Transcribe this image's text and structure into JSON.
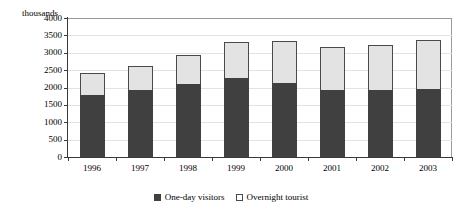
{
  "chart_data": {
    "type": "bar",
    "subtype": "stacked-vertical",
    "title": "",
    "xlabel": "",
    "ylabel": "thousands",
    "categories": [
      "1996",
      "1997",
      "1998",
      "1999",
      "2000",
      "2001",
      "2002",
      "2003"
    ],
    "series": [
      {
        "name": "One-day visitors",
        "color": "#404040",
        "values": [
          1790,
          1930,
          2110,
          2270,
          2140,
          1930,
          1920,
          1960
        ]
      },
      {
        "name": "Overnight tourist",
        "color": "#E3E3E3",
        "values": [
          640,
          690,
          820,
          1040,
          1190,
          1250,
          1300,
          1400
        ]
      }
    ],
    "totals": [
      2430,
      2620,
      2930,
      3310,
      3330,
      3180,
      3220,
      3360
    ],
    "ylim": [
      0,
      4000
    ],
    "ytick_step": 500,
    "yticks": [
      "4000",
      "3500",
      "3000",
      "2500",
      "2000",
      "1500",
      "1000",
      "500",
      "0"
    ],
    "grid": true,
    "legend_position": "bottom"
  },
  "axes": {
    "y_unit_caption": "thousands"
  },
  "legend": {
    "items": [
      {
        "label": "One-day visitors",
        "swatch": "dark-square-icon"
      },
      {
        "label": "Overnight tourist",
        "swatch": "light-square-icon"
      }
    ]
  }
}
